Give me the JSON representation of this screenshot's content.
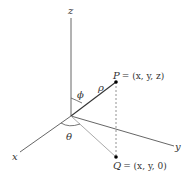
{
  "diagram": {
    "type": "spherical-coordinates",
    "axes": {
      "x": {
        "label": "x"
      },
      "y": {
        "label": "y"
      },
      "z": {
        "label": "z"
      }
    },
    "points": {
      "P": {
        "name": "P",
        "coords": "= (x, y, z)"
      },
      "Q": {
        "name": "Q",
        "coords": "= (x, y, 0)"
      }
    },
    "angles": {
      "phi": {
        "label": "ϕ"
      },
      "theta": {
        "label": "θ"
      }
    },
    "radius": {
      "label": "ρ"
    },
    "colors": {
      "axis": "#444444",
      "projection": "#aaaaaa",
      "point": "#000000",
      "text": "#333333"
    }
  }
}
